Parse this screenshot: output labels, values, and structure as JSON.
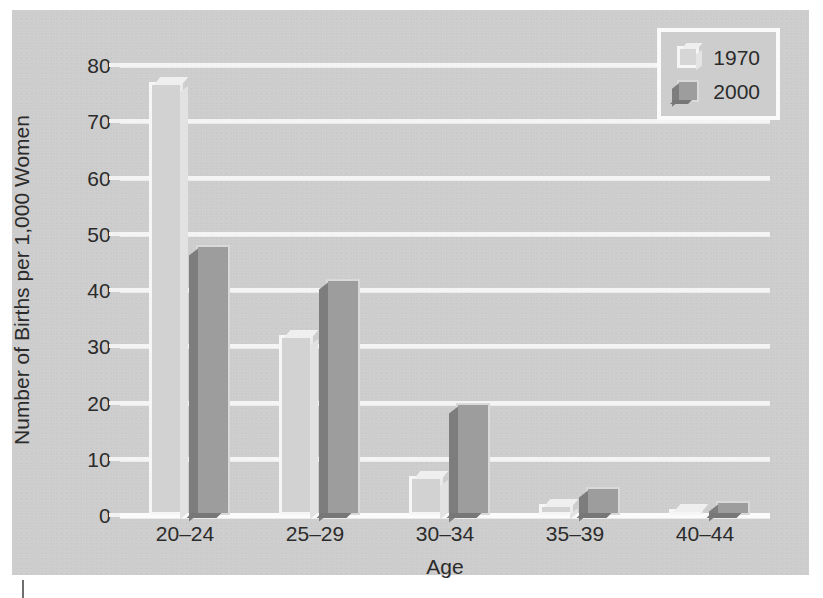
{
  "chart_data": {
    "type": "bar",
    "title": "",
    "xlabel": "Age",
    "ylabel": "Number of Births per 1,000 Women",
    "categories": [
      "20–24",
      "25–29",
      "30–34",
      "35–39",
      "40–44"
    ],
    "series": [
      {
        "name": "1970",
        "values": [
          77,
          32,
          7,
          2,
          1
        ],
        "color": "#d2d2d2"
      },
      {
        "name": "2000",
        "values": [
          48,
          42,
          20,
          5,
          2.5
        ],
        "color": "#9d9d9d"
      }
    ],
    "ylim": [
      0,
      80
    ],
    "yticks": [
      0,
      10,
      20,
      30,
      40,
      50,
      60,
      70,
      80
    ],
    "ytick_labels": [
      "0",
      "10",
      "20",
      "30",
      "40",
      "50",
      "60",
      "70",
      "80"
    ],
    "grid": "horizontal",
    "legend_position": "top-right",
    "style": "3d-grouped-bar",
    "background_color": "#cdcdcd",
    "gridline_color": "#f4f4f4",
    "text_color": "#2b2b2b"
  },
  "legend": {
    "entries": [
      {
        "label": "1970",
        "swatch": "light-3d-box-icon"
      },
      {
        "label": "2000",
        "swatch": "dark-3d-box-icon"
      }
    ]
  },
  "axis": {
    "y_title": "Number of Births per 1,000 Women",
    "x_title": "Age"
  },
  "caption": {
    "text": ""
  }
}
